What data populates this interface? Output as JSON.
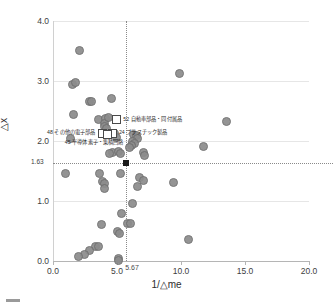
{
  "chart_data": {
    "type": "scatter",
    "title": "",
    "xlabel": "1/△me",
    "ylabel": "△x",
    "xlim": [
      0.0,
      20.0
    ],
    "ylim": [
      0.0,
      4.0
    ],
    "xticks": [
      "0.0",
      "5.0",
      "10.0",
      "15.0",
      "20.0"
    ],
    "yticks": [
      "0.0",
      "1.0",
      "2.0",
      "3.0",
      "4.0"
    ],
    "grid": true,
    "legend": "",
    "reference_lines": {
      "vertical_x": 5.67,
      "vertical_label": "5.67",
      "horizontal_y": 1.63,
      "horizontal_label": "1.63",
      "intersection_marker": "black-square"
    },
    "points": [
      {
        "x": 2.05,
        "y": 3.52
      },
      {
        "x": 1.45,
        "y": 2.95
      },
      {
        "x": 1.72,
        "y": 2.98
      },
      {
        "x": 9.85,
        "y": 3.13
      },
      {
        "x": 2.8,
        "y": 2.66
      },
      {
        "x": 2.95,
        "y": 2.67
      },
      {
        "x": 1.55,
        "y": 2.45
      },
      {
        "x": 4.55,
        "y": 2.72
      },
      {
        "x": 3.55,
        "y": 2.36
      },
      {
        "x": 4.05,
        "y": 2.38
      },
      {
        "x": 4.0,
        "y": 2.3
      },
      {
        "x": 4.3,
        "y": 2.4
      },
      {
        "x": 3.95,
        "y": 2.25
      },
      {
        "x": 4.12,
        "y": 2.22
      },
      {
        "x": 13.55,
        "y": 2.33
      },
      {
        "x": 1.3,
        "y": 2.05
      },
      {
        "x": 4.8,
        "y": 2.13
      },
      {
        "x": 4.9,
        "y": 2.06
      },
      {
        "x": 6.25,
        "y": 2.12
      },
      {
        "x": 6.45,
        "y": 2.1
      },
      {
        "x": 6.55,
        "y": 2.05
      },
      {
        "x": 6.2,
        "y": 2.0
      },
      {
        "x": 6.35,
        "y": 1.96
      },
      {
        "x": 6.1,
        "y": 1.93
      },
      {
        "x": 5.95,
        "y": 1.9
      },
      {
        "x": 11.7,
        "y": 1.91
      },
      {
        "x": 4.6,
        "y": 1.82
      },
      {
        "x": 4.35,
        "y": 1.8
      },
      {
        "x": 5.1,
        "y": 1.83
      },
      {
        "x": 5.25,
        "y": 1.8
      },
      {
        "x": 7.0,
        "y": 1.81
      },
      {
        "x": 7.1,
        "y": 1.76
      },
      {
        "x": 0.95,
        "y": 1.46
      },
      {
        "x": 3.6,
        "y": 1.46
      },
      {
        "x": 5.2,
        "y": 1.46
      },
      {
        "x": 3.8,
        "y": 1.34
      },
      {
        "x": 3.95,
        "y": 1.3
      },
      {
        "x": 4.0,
        "y": 1.22
      },
      {
        "x": 6.7,
        "y": 1.4
      },
      {
        "x": 7.05,
        "y": 1.35
      },
      {
        "x": 9.4,
        "y": 1.32
      },
      {
        "x": 6.6,
        "y": 1.25
      },
      {
        "x": 6.2,
        "y": 0.97
      },
      {
        "x": 5.3,
        "y": 0.8
      },
      {
        "x": 3.75,
        "y": 0.62
      },
      {
        "x": 5.8,
        "y": 0.63
      },
      {
        "x": 6.05,
        "y": 0.63
      },
      {
        "x": 10.55,
        "y": 0.36
      },
      {
        "x": 5.0,
        "y": 0.5
      },
      {
        "x": 5.15,
        "y": 0.47
      },
      {
        "x": 3.3,
        "y": 0.25
      },
      {
        "x": 3.55,
        "y": 0.25
      },
      {
        "x": 2.85,
        "y": 0.18
      },
      {
        "x": 2.45,
        "y": 0.12
      },
      {
        "x": 1.95,
        "y": 0.08
      },
      {
        "x": 5.05,
        "y": 0.05
      },
      {
        "x": 5.1,
        "y": 0.02
      }
    ],
    "highlighted": [
      {
        "code": "52",
        "name": "自動車部品・同付属品",
        "label": "52 自動車部品・同付属品",
        "x": 4.95,
        "y": 2.36,
        "label_side": "right"
      },
      {
        "code": "48",
        "name": "その他の電子部品",
        "label": "48 その他の電子部品",
        "x": 3.85,
        "y": 2.14,
        "label_side": "left"
      },
      {
        "code": "24",
        "name": "プラスチック製品",
        "label": "24 プラスチック製品",
        "x": 4.6,
        "y": 2.14,
        "label_side": "right"
      },
      {
        "code": "45",
        "name": "半導体素子・集積回路",
        "label": "45 半導体素子・集積回路",
        "x": 4.2,
        "y": 2.12,
        "label_side": "below"
      }
    ],
    "marker_color": "#8c8c8c",
    "highlight_marker_color": "#ffffff",
    "reference_marker_color": "#1a1a1a"
  },
  "caption": {
    "text": ""
  }
}
